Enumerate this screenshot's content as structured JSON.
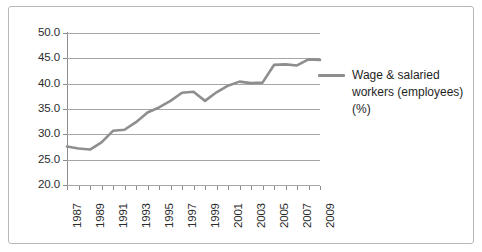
{
  "chart_data": {
    "type": "line",
    "title": "",
    "xlabel": "",
    "ylabel": "",
    "xlim": [
      1987,
      2009
    ],
    "ylim": [
      20.0,
      50.0
    ],
    "grid": true,
    "legend_position": "right",
    "y_ticks": [
      "50.0",
      "45.0",
      "40.0",
      "35.0",
      "30.0",
      "25.0",
      "20.0"
    ],
    "y_tick_values": [
      50.0,
      45.0,
      40.0,
      35.0,
      30.0,
      25.0,
      20.0
    ],
    "x_tick_labels": [
      "1987",
      "1989",
      "1991",
      "1993",
      "1995",
      "1997",
      "1999",
      "2001",
      "2003",
      "2005",
      "2007",
      "2009"
    ],
    "x": [
      1987,
      1988,
      1989,
      1990,
      1991,
      1992,
      1993,
      1994,
      1995,
      1996,
      1997,
      1998,
      1999,
      2000,
      2001,
      2002,
      2003,
      2004,
      2005,
      2006,
      2007,
      2008,
      2009
    ],
    "series": [
      {
        "name": "Wage & salaried workers (employees) (%)",
        "color": "#8e8e8e",
        "values": [
          27.6,
          27.2,
          27.0,
          28.4,
          30.7,
          30.9,
          32.4,
          34.3,
          35.3,
          36.6,
          38.2,
          38.4,
          36.6,
          38.3,
          39.6,
          40.4,
          40.1,
          40.2,
          43.7,
          43.8,
          43.6,
          44.8,
          44.7
        ]
      }
    ]
  },
  "legend": {
    "label": "Wage & salaried workers (employees) (%)"
  },
  "colors": {
    "series": "#8e8e8e",
    "gridline": "#a6a6a6",
    "axis": "#8c8c8c",
    "border": "#b8b8b8",
    "text": "#2b2b2b"
  }
}
